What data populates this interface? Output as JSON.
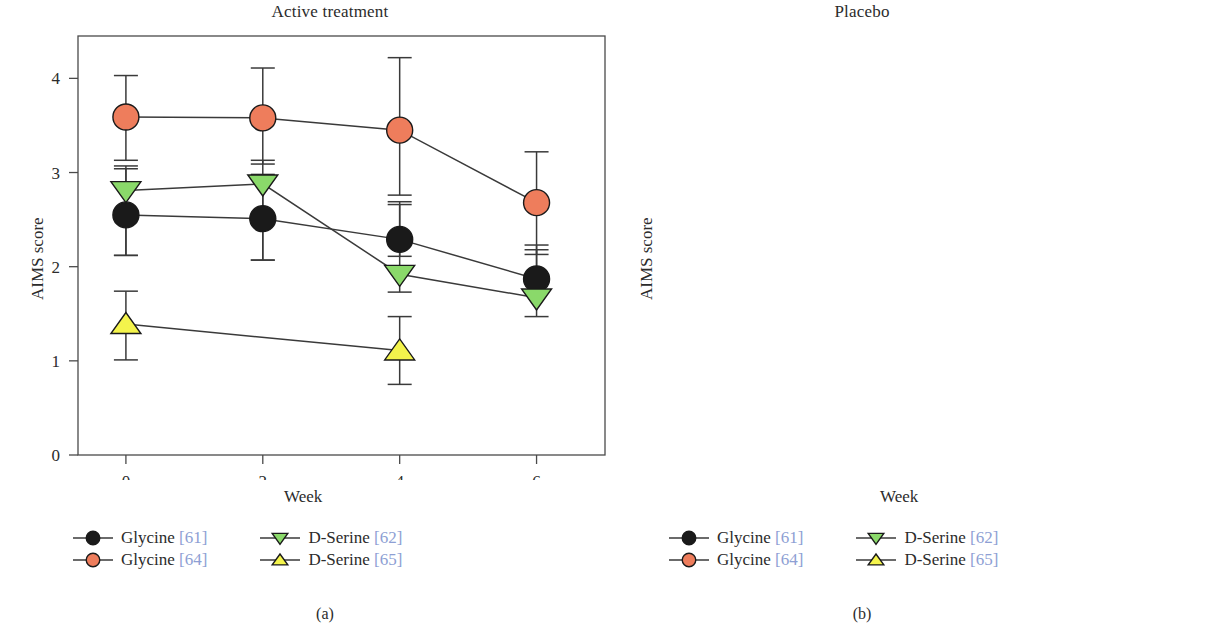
{
  "figure": {
    "caption_a": "(a)",
    "caption_b": "(b)",
    "axis_label_y": "AIMS score",
    "axis_label_x": "Week"
  },
  "colors": {
    "glycine_61": "#1a1a1a",
    "glycine_64": "#ee7d5c",
    "dserine_62": "#8ad96a",
    "dserine_65": "#f4f44c",
    "line": "#3a3a3a",
    "axis": "#4a4a4a",
    "citation": "#8e9fd4"
  },
  "legend": {
    "items": [
      {
        "label": "Glycine",
        "citation": "[61]",
        "marker": "circle",
        "color": "#1a1a1a",
        "name": "glycine-61"
      },
      {
        "label": "D-Serine",
        "citation": "[62]",
        "marker": "triangle-down",
        "color": "#8ad96a",
        "name": "dserine-62"
      },
      {
        "label": "Glycine",
        "citation": "[64]",
        "marker": "circle",
        "color": "#ee7d5c",
        "name": "glycine-64"
      },
      {
        "label": "D-Serine",
        "citation": "[65]",
        "marker": "triangle-up",
        "color": "#f4f44c",
        "name": "dserine-65"
      }
    ]
  },
  "chart_data": [
    {
      "type": "line",
      "panel": "a",
      "title": "Active treatment",
      "xlabel": "Week",
      "ylabel": "AIMS score",
      "x": [
        0,
        2,
        4,
        6
      ],
      "xticklabels": [
        "0",
        "2",
        "4",
        "6"
      ],
      "yticklabels": [
        "0",
        "1",
        "2",
        "3",
        "4"
      ],
      "yticks": [
        0,
        1,
        2,
        3,
        4
      ],
      "xlim": [
        -0.7,
        7.0
      ],
      "ylim": [
        0,
        4.45
      ],
      "grid": false,
      "legend_position": "below",
      "series": [
        {
          "name": "Glycine [61]",
          "marker": "circle",
          "color": "#1a1a1a",
          "x": [
            0,
            2,
            4,
            6
          ],
          "values": [
            2.55,
            2.51,
            2.29,
            1.87
          ],
          "err_low": [
            2.12,
            2.07,
            2.11,
            1.73
          ],
          "err_high": [
            3.04,
            2.98,
            2.66,
            2.23
          ]
        },
        {
          "name": "Glycine [64]",
          "marker": "circle",
          "color": "#ee7d5c",
          "x": [
            0,
            2,
            4,
            6
          ],
          "values": [
            3.59,
            3.58,
            3.45,
            2.68
          ],
          "err_low": [
            3.13,
            3.09,
            2.76,
            2.13
          ],
          "err_high": [
            4.03,
            4.11,
            4.22,
            3.22
          ]
        },
        {
          "name": "D-Serine [62]",
          "marker": "triangle-down",
          "color": "#8ad96a",
          "x": [
            0,
            2,
            4,
            6
          ],
          "values": [
            2.81,
            2.88,
            1.92,
            1.67
          ],
          "err_low": [
            2.12,
            2.07,
            1.73,
            1.47
          ],
          "err_high": [
            3.07,
            3.13,
            2.69,
            2.18
          ]
        },
        {
          "name": "D-Serine [65]",
          "marker": "triangle-up",
          "color": "#f4f44c",
          "x": [
            0,
            4
          ],
          "values": [
            1.39,
            1.11
          ],
          "err_low": [
            1.01,
            0.75
          ],
          "err_high": [
            1.74,
            1.47
          ]
        }
      ]
    },
    {
      "type": "line",
      "panel": "b",
      "title": "Placebo",
      "xlabel": "Week",
      "ylabel": "AIMS score",
      "x": [
        0,
        2,
        4,
        6
      ],
      "xticklabels": [
        "0",
        "2",
        "4",
        "6"
      ],
      "yticklabels": [
        "0",
        "1",
        "2",
        "3",
        "4"
      ],
      "yticks": [
        0,
        1,
        2,
        3,
        4
      ],
      "xlim": [
        -0.7,
        7.6
      ],
      "ylim": [
        0,
        4.45
      ],
      "grid": false,
      "legend_position": "below",
      "series": [
        {
          "name": "Glycine [61]",
          "marker": "circle",
          "color": "#1a1a1a",
          "x": [
            0,
            2,
            4,
            6
          ],
          "values": [
            2.09,
            2.03,
            2.22,
            2.3
          ],
          "err_low": [
            1.73,
            1.65,
            1.83,
            1.87
          ],
          "err_high": [
            2.46,
            2.31,
            2.62,
            2.7
          ]
        },
        {
          "name": "Glycine [64]",
          "marker": "circle",
          "color": "#ee7d5c",
          "x": [
            0,
            2,
            4,
            6
          ],
          "values": [
            2.83,
            2.63,
            3.1,
            3.1
          ],
          "err_low": [
            2.62,
            2.38,
            2.97,
            2.97
          ],
          "err_high": [
            3.21,
            3.01,
            3.53,
            3.58
          ]
        },
        {
          "name": "D-Serine [62]",
          "marker": "triangle-down",
          "color": "#8ad96a",
          "x": [
            0,
            2,
            4,
            6
          ],
          "values": [
            2.44,
            2.51,
            2.5,
            2.56
          ],
          "err_low": [
            2.3,
            2.26,
            2.4,
            2.48
          ],
          "err_high": [
            2.6,
            2.72,
            2.64,
            2.68
          ]
        }
      ]
    }
  ]
}
